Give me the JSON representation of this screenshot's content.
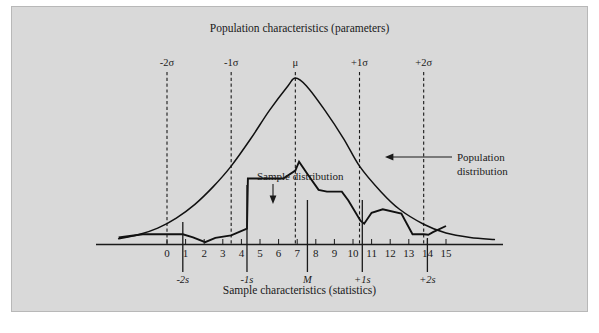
{
  "figure": {
    "top_caption": "Population characteristics (parameters)",
    "bottom_caption": "Sample characteristics (statistics)",
    "background_color": "#d9d9d9",
    "ink_color": "#1a1a1a"
  },
  "annotations": {
    "sample": {
      "label": "Sample distribution"
    },
    "population": {
      "line1": "Population",
      "line2": "distribution"
    }
  },
  "parameter_markers": [
    {
      "name": "minus-2-sigma",
      "label": "-2σ",
      "x": 0.0
    },
    {
      "name": "minus-1-sigma",
      "label": "-1σ",
      "x": 3.45
    },
    {
      "name": "mu",
      "label": "μ",
      "x": 6.9
    },
    {
      "name": "plus-1-sigma",
      "label": "+1σ",
      "x": 10.35
    },
    {
      "name": "plus-2-sigma",
      "label": "+2σ",
      "x": 13.8
    }
  ],
  "statistic_markers": [
    {
      "name": "minus-2-s",
      "label": "-2s",
      "x": 0.85
    },
    {
      "name": "minus-1-s",
      "label": "-1s",
      "x": 4.3
    },
    {
      "name": "median",
      "label": "M",
      "x": 7.55
    },
    {
      "name": "plus-1-s",
      "label": "+1s",
      "x": 10.5
    },
    {
      "name": "plus-2-s",
      "label": "+2s",
      "x": 14.0
    }
  ],
  "chart_data": {
    "type": "line",
    "title": "Population characteristics (parameters)",
    "subtitle": "Sample characteristics (statistics)",
    "xlabel": "",
    "ylabel": "",
    "xlim": [
      -2.6,
      17.6
    ],
    "ylim": [
      0,
      1
    ],
    "grid": false,
    "legend": "annotated",
    "tick_labels": [
      "0",
      "1",
      "2",
      "3",
      "4",
      "5",
      "6",
      "7",
      "8",
      "9",
      "10",
      "11",
      "12",
      "13",
      "14",
      "15"
    ],
    "tick_values": [
      0,
      1,
      2,
      3,
      4,
      5,
      6,
      7,
      8,
      9,
      10,
      11,
      12,
      13,
      14,
      15
    ],
    "series": [
      {
        "name": "Population distribution",
        "kind": "smooth-normal-curve",
        "mean": 6.9,
        "sigma": 3.45,
        "peak": 0.945,
        "x": [
          -2.6,
          -1.5,
          -0.5,
          0.5,
          1.5,
          2.5,
          3.45,
          4.5,
          5.5,
          6.5,
          6.9,
          7.5,
          8.5,
          9.5,
          10.35,
          11.5,
          12.5,
          13.8,
          15,
          16.3,
          17.6
        ],
        "values": [
          0.033,
          0.057,
          0.093,
          0.15,
          0.228,
          0.33,
          0.445,
          0.6,
          0.76,
          0.9,
          0.945,
          0.9,
          0.76,
          0.6,
          0.445,
          0.3,
          0.2,
          0.115,
          0.065,
          0.04,
          0.028
        ]
      },
      {
        "name": "Sample distribution",
        "kind": "step-polyline",
        "x": [
          -2.6,
          -1.3,
          0.0,
          0.0,
          0.85,
          1.4,
          2.05,
          2.6,
          3.45,
          4.3,
          4.35,
          6.25,
          6.9,
          7.1,
          7.55,
          8.15,
          8.6,
          9.4,
          9.75,
          10.4,
          10.6,
          11.0,
          11.6,
          12.6,
          13.2,
          13.8,
          14.05,
          14.3,
          15.0
        ],
        "values": [
          0.04,
          0.058,
          0.058,
          0.058,
          0.058,
          0.04,
          0.013,
          0.038,
          0.052,
          0.09,
          0.375,
          0.375,
          0.42,
          0.47,
          0.4,
          0.31,
          0.3,
          0.3,
          0.25,
          0.135,
          0.118,
          0.18,
          0.2,
          0.175,
          0.058,
          0.058,
          0.055,
          0.07,
          0.105
        ]
      }
    ]
  }
}
